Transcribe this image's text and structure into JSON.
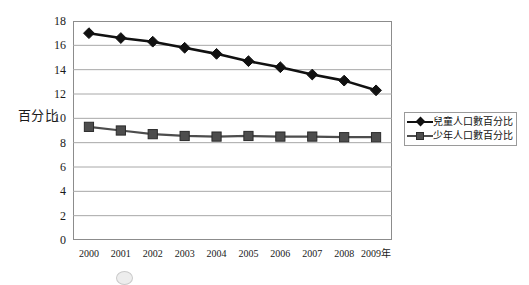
{
  "chart_data": {
    "type": "line",
    "title": "",
    "xlabel": "",
    "ylabel": "百分比",
    "x_unit_suffix": "年",
    "categories": [
      "2000",
      "2001",
      "2002",
      "2003",
      "2004",
      "2005",
      "2006",
      "2007",
      "2008",
      "2009"
    ],
    "xtick_labels": [
      "2000",
      "2001",
      "2002",
      "2003",
      "2004",
      "2005",
      "2006",
      "2007",
      "2008",
      "2009年"
    ],
    "ylim": [
      0,
      18
    ],
    "ytick_labels": [
      "18",
      "16",
      "14",
      "12",
      "10",
      "8",
      "6",
      "4",
      "2",
      "0"
    ],
    "ytick_values": [
      18,
      16,
      14,
      12,
      10,
      8,
      6,
      4,
      2,
      0
    ],
    "grid": true,
    "grid_axis": "y",
    "legend_position": "right",
    "series": [
      {
        "name": "兒童人口數百分比",
        "marker": "diamond",
        "color": "#111111",
        "values": [
          17.0,
          16.6,
          16.3,
          15.8,
          15.3,
          14.7,
          14.2,
          13.6,
          13.1,
          12.3
        ]
      },
      {
        "name": "少年人口數百分比",
        "marker": "square",
        "color": "#4d4d4d",
        "values": [
          9.3,
          9.0,
          8.7,
          8.55,
          8.5,
          8.55,
          8.5,
          8.5,
          8.45,
          8.45
        ]
      }
    ]
  },
  "colors": {
    "axis": "#8c8c8c",
    "grid": "#a8a8a8",
    "series_primary": "#111111",
    "series_secondary": "#4d4d4d",
    "text": "#1a1a1a",
    "background": "#ffffff"
  }
}
